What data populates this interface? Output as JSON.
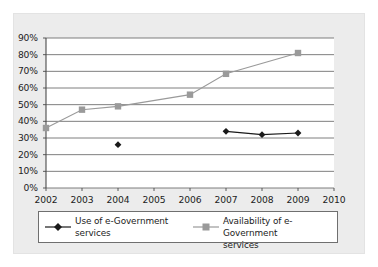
{
  "chart_data": {
    "type": "line",
    "title": "",
    "subtitle": "",
    "xlabel": "",
    "ylabel": "",
    "x": [
      2002,
      2003,
      2004,
      2005,
      2006,
      2007,
      2008,
      2009,
      2010
    ],
    "xlim": [
      2002,
      2010
    ],
    "ylim": [
      0,
      90
    ],
    "ytick_values": [
      0,
      10,
      20,
      30,
      40,
      50,
      60,
      70,
      80,
      90
    ],
    "ytick_labels": [
      "0%",
      "10%",
      "20%",
      "30%",
      "40%",
      "50%",
      "60%",
      "70%",
      "80%",
      "90%"
    ],
    "xtick_labels": [
      "2002",
      "2003",
      "2004",
      "2005",
      "2006",
      "2007",
      "2008",
      "2009",
      "2010"
    ],
    "grid": "horizontal",
    "legend_position": "below",
    "series": [
      {
        "name": "Use of e-Government services",
        "label_line_1": "Use of e-Government",
        "label_line_2": "services",
        "color": "#1a1a1a",
        "marker": "diamond",
        "points": [
          {
            "x": 2004,
            "y": 26,
            "connected": false
          },
          {
            "x": 2007,
            "y": 34,
            "connected": true
          },
          {
            "x": 2008,
            "y": 32,
            "connected": true
          },
          {
            "x": 2009,
            "y": 33,
            "connected": true
          }
        ]
      },
      {
        "name": "Availability of e-Government services",
        "label_line_1": "Availability of e-Government",
        "label_line_2": "services",
        "color": "#9a9a9a",
        "marker": "square",
        "points": [
          {
            "x": 2002,
            "y": 36,
            "connected": true
          },
          {
            "x": 2003,
            "y": 47,
            "connected": true
          },
          {
            "x": 2004,
            "y": 49,
            "connected": true
          },
          {
            "x": 2006,
            "y": 56,
            "connected": true
          },
          {
            "x": 2007,
            "y": 68.5,
            "connected": true
          },
          {
            "x": 2009,
            "y": 81,
            "connected": false
          }
        ]
      }
    ],
    "colors": {
      "panel_background": "#ececec",
      "plot_background": "#ffffff",
      "axis": "#4a4a4a",
      "gridline": "#6f6f6f",
      "text": "#1c1c1c",
      "series_use": "#1a1a1a",
      "series_availability": "#9a9a9a",
      "legend_border": "#6f6f6f"
    }
  }
}
